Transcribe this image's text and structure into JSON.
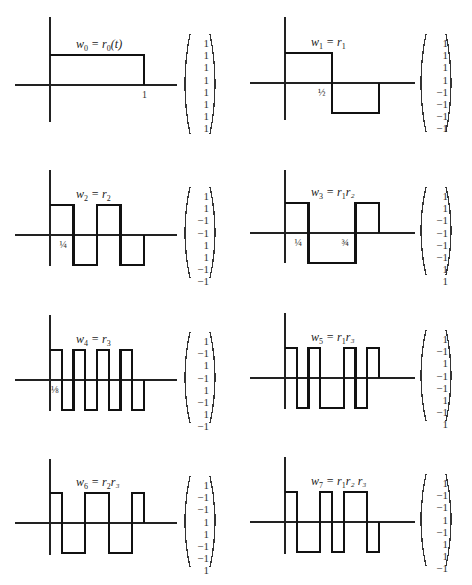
{
  "figure": {
    "panels": [
      {
        "name": "w0",
        "label_main": "w",
        "label_sub": "0",
        "label_rest": " = r",
        "label_rest_sub": "0",
        "label_tail": "(t)",
        "values": [
          1,
          1,
          1,
          1,
          1,
          1,
          1,
          1
        ],
        "tick_label": "1",
        "tick_pos": 1.0,
        "vector": [
          "1",
          "1",
          "1",
          "1",
          "1",
          "1",
          "1",
          "1"
        ]
      },
      {
        "name": "w1",
        "label_main": "w",
        "label_sub": "1",
        "label_rest": " = r",
        "label_rest_sub": "1",
        "label_tail": "",
        "values": [
          1,
          1,
          1,
          1,
          -1,
          -1,
          -1,
          -1
        ],
        "tick_label": "½",
        "tick_pos": 0.5,
        "vector": [
          "1",
          "1",
          "1",
          "1",
          "−1",
          "−1",
          "−1",
          "−1"
        ]
      },
      {
        "name": "w2",
        "label_main": "w",
        "label_sub": "2",
        "label_rest": " = r",
        "label_rest_sub": "2",
        "label_tail": "",
        "values": [
          1,
          1,
          -1,
          -1,
          1,
          1,
          -1,
          -1
        ],
        "tick_label": "¼",
        "tick_pos": 0.25,
        "vector": [
          "1",
          "1",
          "−1",
          "−1",
          "1",
          "1",
          "−1",
          "−1"
        ]
      },
      {
        "name": "w3",
        "label_main": "w",
        "label_sub": "3",
        "label_rest": " = r",
        "label_rest_sub": "1",
        "label_tail": "r₂",
        "values": [
          1,
          1,
          -1,
          -1,
          -1,
          -1,
          1,
          1
        ],
        "tick_label": "¼",
        "tick_pos": 0.25,
        "tick2_label": "¾",
        "tick2_pos": 0.75,
        "vector": [
          "1",
          "1",
          "−1",
          "−1",
          "−1",
          "−1",
          "1",
          "1"
        ]
      },
      {
        "name": "w4",
        "label_main": "w",
        "label_sub": "4",
        "label_rest": " = r",
        "label_rest_sub": "3",
        "label_tail": "",
        "values": [
          1,
          -1,
          1,
          -1,
          1,
          -1,
          1,
          -1
        ],
        "tick_label": "⅛",
        "tick_pos": 0.125,
        "vector": [
          "1",
          "−1",
          "1",
          "−1",
          "1",
          "−1",
          "1",
          "−1"
        ]
      },
      {
        "name": "w5",
        "label_main": "w",
        "label_sub": "5",
        "label_rest": " = r",
        "label_rest_sub": "1",
        "label_tail": "r₃",
        "values": [
          1,
          -1,
          1,
          -1,
          -1,
          1,
          -1,
          1
        ],
        "tick_label": "",
        "tick_pos": null,
        "vector": [
          "1",
          "−1",
          "1",
          "−1",
          "−1",
          "1",
          "−1",
          "1"
        ]
      },
      {
        "name": "w6",
        "label_main": "w",
        "label_sub": "6",
        "label_rest": " = r",
        "label_rest_sub": "2",
        "label_tail": "r₃",
        "values": [
          1,
          -1,
          -1,
          1,
          1,
          -1,
          -1,
          1
        ],
        "tick_label": "",
        "tick_pos": null,
        "vector": [
          "1",
          "−1",
          "−1",
          "1",
          "1",
          "−1",
          "−1",
          "1"
        ]
      },
      {
        "name": "w7",
        "label_main": "w",
        "label_sub": "7",
        "label_rest": " = r",
        "label_rest_sub": "1",
        "label_tail": "r₂ r₃",
        "values": [
          1,
          -1,
          -1,
          1,
          -1,
          1,
          1,
          -1
        ],
        "tick_label": "",
        "tick_pos": null,
        "vector": [
          "1",
          "−1",
          "−1",
          "1",
          "−1",
          "1",
          "1",
          "−1"
        ]
      }
    ]
  },
  "chart_data": {
    "type": "line",
    "x": [
      0,
      0.125,
      0.25,
      0.375,
      0.5,
      0.625,
      0.75,
      0.875
    ],
    "xlabel": "t",
    "ylabel": "w_k(t)",
    "ylim": [
      -1,
      1
    ],
    "series": [
      {
        "name": "w0 = r0(t)",
        "values": [
          1,
          1,
          1,
          1,
          1,
          1,
          1,
          1
        ]
      },
      {
        "name": "w1 = r1",
        "values": [
          1,
          1,
          1,
          1,
          -1,
          -1,
          -1,
          -1
        ]
      },
      {
        "name": "w2 = r2",
        "values": [
          1,
          1,
          -1,
          -1,
          1,
          1,
          -1,
          -1
        ]
      },
      {
        "name": "w3 = r1 r2",
        "values": [
          1,
          1,
          -1,
          -1,
          -1,
          -1,
          1,
          1
        ]
      },
      {
        "name": "w4 = r3",
        "values": [
          1,
          -1,
          1,
          -1,
          1,
          -1,
          1,
          -1
        ]
      },
      {
        "name": "w5 = r1 r3",
        "values": [
          1,
          -1,
          1,
          -1,
          -1,
          1,
          -1,
          1
        ]
      },
      {
        "name": "w6 = r2 r3",
        "values": [
          1,
          -1,
          -1,
          1,
          1,
          -1,
          -1,
          1
        ]
      },
      {
        "name": "w7 = r1 r2 r3",
        "values": [
          1,
          -1,
          -1,
          1,
          -1,
          1,
          1,
          -1
        ]
      }
    ],
    "annotations": [
      "1",
      "½",
      "¼",
      "¾",
      "⅛"
    ]
  }
}
